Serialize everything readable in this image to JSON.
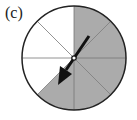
{
  "figure": {
    "label": "(c)",
    "spinner": {
      "sectors_total": 8,
      "shaded_sectors": [
        0,
        1,
        2,
        3,
        4
      ],
      "shaded_color": "#ababab",
      "unshaded_color": "#ffffff",
      "line_color": "#222222",
      "arrow": {
        "direction": "down-left",
        "points_to_sector": 4,
        "color": "#111111"
      }
    }
  }
}
